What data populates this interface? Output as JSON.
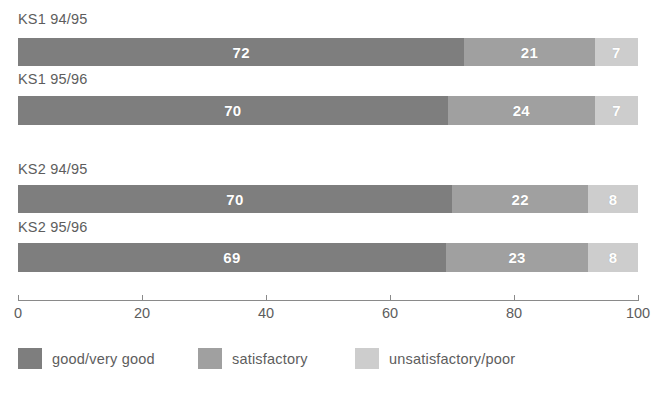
{
  "chart_data": {
    "type": "bar",
    "orientation": "horizontal",
    "stacked": true,
    "title": "",
    "subtitle": "",
    "xlabel": "",
    "ylabel": "",
    "xlim": [
      0,
      100
    ],
    "grid": false,
    "legend_position": "bottom",
    "categories": [
      "KS1 94/95",
      "KS1 95/96",
      "KS2 94/95",
      "KS2 95/96"
    ],
    "series": [
      {
        "name": "good/very good",
        "color": "#7e7e7e",
        "values": [
          72,
          70,
          70,
          69
        ]
      },
      {
        "name": "satisfactory",
        "color": "#a0a0a0",
        "values": [
          21,
          24,
          22,
          23
        ]
      },
      {
        "name": "unsatisfactory/poor",
        "color": "#cdcdcd",
        "values": [
          7,
          7,
          8,
          8
        ]
      }
    ],
    "x_ticks": [
      0,
      20,
      40,
      60,
      80,
      100
    ],
    "x_tick_labels": [
      "0",
      "20",
      "40",
      "60",
      "80",
      "100"
    ],
    "axis_color": "#8a8a8a",
    "text_color": "#5d5d5d",
    "value_label_color": "#ffffff"
  },
  "rows": [
    {
      "label": "KS1 94/95",
      "label_top": 11,
      "bar_top": 38,
      "bar_height": 28,
      "segments": [
        {
          "name": "good/very good",
          "value": 72,
          "display": "72",
          "color": "#7e7e7e"
        },
        {
          "name": "satisfactory",
          "value": 21,
          "display": "21",
          "color": "#a0a0a0"
        },
        {
          "name": "unsatisfactory/poor",
          "value": 7,
          "display": "7",
          "color": "#cdcdcd"
        }
      ]
    },
    {
      "label": "KS1 95/96",
      "label_top": 71,
      "bar_top": 96,
      "bar_height": 29,
      "segments": [
        {
          "name": "good/very good",
          "value": 70,
          "display": "70",
          "color": "#7e7e7e"
        },
        {
          "name": "satisfactory",
          "value": 24,
          "display": "24",
          "color": "#a0a0a0"
        },
        {
          "name": "unsatisfactory/poor",
          "value": 7,
          "display": "7",
          "color": "#cdcdcd"
        }
      ]
    },
    {
      "label": "KS2 94/95",
      "label_top": 161,
      "bar_top": 185,
      "bar_height": 28,
      "segments": [
        {
          "name": "good/very good",
          "value": 70,
          "display": "70",
          "color": "#7e7e7e"
        },
        {
          "name": "satisfactory",
          "value": 22,
          "display": "22",
          "color": "#a0a0a0"
        },
        {
          "name": "unsatisfactory/poor",
          "value": 8,
          "display": "8",
          "color": "#cdcdcd"
        }
      ]
    },
    {
      "label": "KS2 95/96",
      "label_top": 219,
      "bar_top": 243,
      "bar_height": 29,
      "segments": [
        {
          "name": "good/very good",
          "value": 69,
          "display": "69",
          "color": "#7e7e7e"
        },
        {
          "name": "satisfactory",
          "value": 23,
          "display": "23",
          "color": "#a0a0a0"
        },
        {
          "name": "unsatisfactory/poor",
          "value": 8,
          "display": "8",
          "color": "#cdcdcd"
        }
      ]
    }
  ],
  "axis": {
    "ticks": [
      {
        "value": 0,
        "label": "0"
      },
      {
        "value": 20,
        "label": "20"
      },
      {
        "value": 40,
        "label": "40"
      },
      {
        "value": 60,
        "label": "60"
      },
      {
        "value": 80,
        "label": "80"
      },
      {
        "value": 100,
        "label": "100"
      }
    ]
  },
  "legend": {
    "items": [
      {
        "label": "good/very good",
        "color": "#7e7e7e",
        "left": 18
      },
      {
        "label": "satisfactory",
        "color": "#a0a0a0",
        "left": 198
      },
      {
        "label": "unsatisfactory/poor",
        "color": "#cdcdcd",
        "left": 355
      }
    ]
  }
}
